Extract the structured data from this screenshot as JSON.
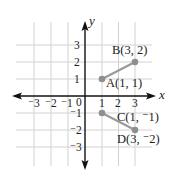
{
  "diagram": {
    "type": "coordinate-plane",
    "axes": {
      "x_label": "x",
      "y_label": "y",
      "x_ticks": [
        {
          "value": -3,
          "label": "⁻3"
        },
        {
          "value": -2,
          "label": "⁻2"
        },
        {
          "value": -1,
          "label": "⁻1"
        },
        {
          "value": 0,
          "label": "0"
        },
        {
          "value": 1,
          "label": "1"
        },
        {
          "value": 2,
          "label": "2"
        },
        {
          "value": 3,
          "label": "3"
        }
      ],
      "y_ticks": [
        {
          "value": 3,
          "label": "3"
        },
        {
          "value": 2,
          "label": "2"
        },
        {
          "value": 1,
          "label": "1"
        },
        {
          "value": -1,
          "label": "⁻1"
        },
        {
          "value": -2,
          "label": "⁻2"
        },
        {
          "value": -3,
          "label": "⁻3"
        }
      ]
    },
    "points": [
      {
        "name": "A",
        "x": 1,
        "y": 1,
        "label": "A(1, 1)"
      },
      {
        "name": "B",
        "x": 3,
        "y": 2,
        "label": "B(3, 2)"
      },
      {
        "name": "C",
        "x": 1,
        "y": -1,
        "label": "C(1, ⁻1)"
      },
      {
        "name": "D",
        "x": 3,
        "y": -2,
        "label": "D(3, ⁻2)"
      }
    ],
    "segments": [
      {
        "from": "A",
        "to": "B"
      },
      {
        "from": "C",
        "to": "D"
      }
    ],
    "colors": {
      "grid": "#d2d2d2",
      "axis": "#111111",
      "segment": "#9a9a9a",
      "point": "#8f8f8f"
    }
  }
}
